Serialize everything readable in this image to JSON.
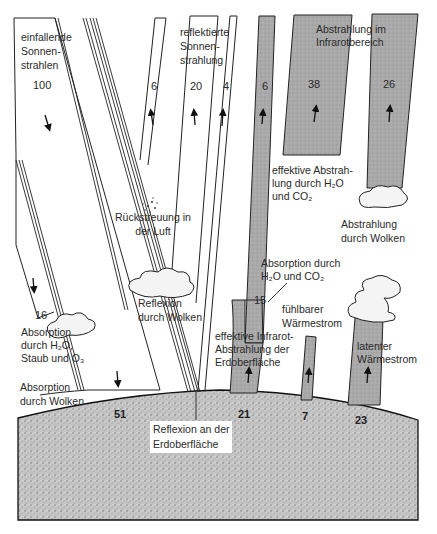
{
  "colors": {
    "background": "#ffffff",
    "line": "#222222",
    "infrared_band": "#a8a8a8",
    "ground": "#b5b5b5"
  },
  "labels": {
    "incoming": [
      "einfallende",
      "Sonnen-",
      "strahlen"
    ],
    "reflected": [
      "reflektierte",
      "Sonnen-",
      "strahlung"
    ],
    "infrared": [
      "Abstrahlung im",
      "Infrarotbereich"
    ],
    "backscatter": [
      "Rückstreuung in",
      "der Luft"
    ],
    "effective_h2o": [
      "effektive Abstrah-",
      "lung durch H₂O",
      "und CO₂"
    ],
    "cloud_emission": [
      "Abstrahlung",
      "durch Wolken"
    ],
    "cloud_reflection": [
      "Reflexion",
      "durch Wolken"
    ],
    "absorption_h2o_co2": [
      "Absorption durch",
      "H₂O und CO₂"
    ],
    "sensible_heat": [
      "fühlbarer",
      "Wärmestrom"
    ],
    "absorption_gas": [
      "Absorption",
      "durch H₂O,",
      "Staub und O₃"
    ],
    "absorption_clouds": [
      "Absorption",
      "durch Wolken"
    ],
    "effective_ir_surface": [
      "effektive Infrarot-",
      "Abstrahlung der",
      "Erdoberfläche"
    ],
    "latent_heat": [
      "latenter",
      "Wärmestrom"
    ],
    "surface_reflection": [
      "Reflexion an der",
      "Erdoberfläche"
    ]
  },
  "values": {
    "incoming": "100",
    "backscatter": "6",
    "cloud_reflection": "20",
    "surface_reflection": "4",
    "surface_ir_escape": "6",
    "atmos_emission": "38",
    "cloud_emission": "26",
    "absorbed_atmos": "16",
    "ir_absorbed": "15",
    "surface_absorbed": "51",
    "surface_ir": "21",
    "sensible": "7",
    "latent": "23"
  }
}
